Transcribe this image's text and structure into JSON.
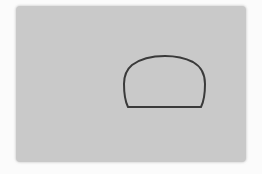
{
  "image": {
    "description": "Gray rectangular card with a dome-shaped outline drawn on it",
    "background_color": "#fbfbfb",
    "panel": {
      "color": "#c9c9c9"
    },
    "dome": {
      "stroke_color": "#3a3a3a",
      "fill_color": "#c9c9c9",
      "stroke_width": 2
    }
  }
}
